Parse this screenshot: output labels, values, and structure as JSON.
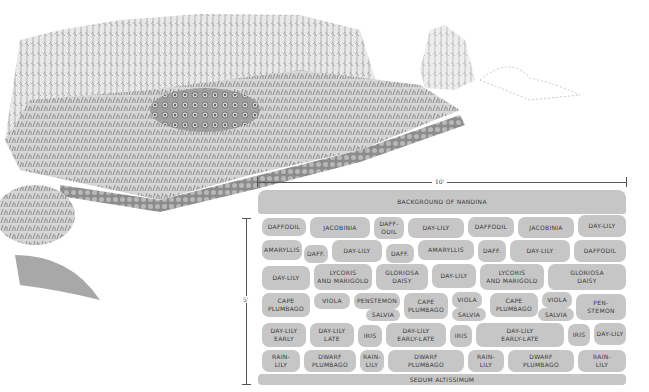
{
  "illustration": {
    "description": "Pen-and-ink perspective drawing of a planted flower border with tall Nandina background, rounded flowering masses, iris and lily clumps, a low sedum edging, a distant shrub at right and a leafy shrub at lower left"
  },
  "dimensions": {
    "width_label": "10'",
    "depth_label": "5'"
  },
  "plan": {
    "background_row": {
      "label": "BACKGROUND OF NANDINA"
    },
    "edging_row": {
      "label": "SEDUM ALTISSIMUM"
    },
    "cells": [
      {
        "label": "DAFFODIL",
        "x": 6,
        "y": 30,
        "w": 44,
        "h": 18
      },
      {
        "label": "JACOBINIA",
        "x": 54,
        "y": 29,
        "w": 60,
        "h": 21
      },
      {
        "label": "DAFF-\nODIL",
        "x": 118,
        "y": 29,
        "w": 30,
        "h": 22
      },
      {
        "label": "DAY-LILY",
        "x": 152,
        "y": 30,
        "w": 56,
        "h": 20
      },
      {
        "label": "DAFFODIL",
        "x": 212,
        "y": 29,
        "w": 46,
        "h": 20
      },
      {
        "label": "JACOBINIA",
        "x": 262,
        "y": 29,
        "w": 56,
        "h": 21
      },
      {
        "label": "DAY-LILY",
        "x": 322,
        "y": 27,
        "w": 48,
        "h": 22
      },
      {
        "label": "AMARYLLIS",
        "x": 6,
        "y": 52,
        "w": 40,
        "h": 20
      },
      {
        "label": "DAFF.",
        "x": 48,
        "y": 57,
        "w": 24,
        "h": 18
      },
      {
        "label": "DAY-LILY",
        "x": 76,
        "y": 52,
        "w": 50,
        "h": 22
      },
      {
        "label": "DAFF.",
        "x": 130,
        "y": 56,
        "w": 28,
        "h": 19
      },
      {
        "label": "AMARYLLIS",
        "x": 162,
        "y": 52,
        "w": 56,
        "h": 20
      },
      {
        "label": "DAFF.",
        "x": 222,
        "y": 52,
        "w": 28,
        "h": 22
      },
      {
        "label": "DAY-LILY",
        "x": 254,
        "y": 52,
        "w": 60,
        "h": 22
      },
      {
        "label": "DAFFODIL",
        "x": 318,
        "y": 52,
        "w": 52,
        "h": 22
      },
      {
        "label": "DAY-LILY",
        "x": 6,
        "y": 78,
        "w": 48,
        "h": 24
      },
      {
        "label": "LYCORIS\nAND MARIGOLD",
        "x": 58,
        "y": 76,
        "w": 58,
        "h": 26
      },
      {
        "label": "GLORIOSA\nDAISY",
        "x": 120,
        "y": 76,
        "w": 52,
        "h": 26
      },
      {
        "label": "DAY-LILY",
        "x": 176,
        "y": 76,
        "w": 44,
        "h": 24
      },
      {
        "label": "LYCORIS\nAND MARIGOLD",
        "x": 224,
        "y": 76,
        "w": 64,
        "h": 26
      },
      {
        "label": "GLORIOSA\nDAISY",
        "x": 292,
        "y": 76,
        "w": 78,
        "h": 26
      },
      {
        "label": "CAPE\nPLUMBAGO",
        "x": 6,
        "y": 105,
        "w": 48,
        "h": 24
      },
      {
        "label": "VIOLA",
        "x": 58,
        "y": 105,
        "w": 36,
        "h": 16
      },
      {
        "label": "PENSTEMON",
        "x": 98,
        "y": 105,
        "w": 46,
        "h": 16
      },
      {
        "label": "SALVIA",
        "x": 110,
        "y": 121,
        "w": 34,
        "h": 12
      },
      {
        "label": "CAPE\nPLUMBAGO",
        "x": 148,
        "y": 105,
        "w": 44,
        "h": 26
      },
      {
        "label": "VIOLA",
        "x": 196,
        "y": 104,
        "w": 30,
        "h": 16
      },
      {
        "label": "SALVIA",
        "x": 196,
        "y": 120,
        "w": 34,
        "h": 13
      },
      {
        "label": "CAPE\nPLUMBAGO",
        "x": 234,
        "y": 105,
        "w": 48,
        "h": 24
      },
      {
        "label": "VIOLA",
        "x": 286,
        "y": 104,
        "w": 30,
        "h": 16
      },
      {
        "label": "SALVIA",
        "x": 282,
        "y": 120,
        "w": 36,
        "h": 13
      },
      {
        "label": "PEN-\nSTEMON",
        "x": 320,
        "y": 106,
        "w": 50,
        "h": 26
      },
      {
        "label": "DAY-LILY\nEARLY",
        "x": 6,
        "y": 135,
        "w": 44,
        "h": 24
      },
      {
        "label": "DAY-LILY\nLATE",
        "x": 54,
        "y": 135,
        "w": 44,
        "h": 24
      },
      {
        "label": "IRIS",
        "x": 102,
        "y": 137,
        "w": 24,
        "h": 22
      },
      {
        "label": "DAY-LILY\nEARLY-LATE",
        "x": 130,
        "y": 135,
        "w": 60,
        "h": 24
      },
      {
        "label": "IRIS",
        "x": 194,
        "y": 137,
        "w": 22,
        "h": 22
      },
      {
        "label": "DAY-LILY\nEARLY-LATE",
        "x": 220,
        "y": 135,
        "w": 88,
        "h": 24
      },
      {
        "label": "IRIS",
        "x": 312,
        "y": 136,
        "w": 22,
        "h": 22
      },
      {
        "label": "DAY-LILY",
        "x": 338,
        "y": 135,
        "w": 32,
        "h": 22
      },
      {
        "label": "RAIN-\nLILY",
        "x": 6,
        "y": 162,
        "w": 38,
        "h": 22
      },
      {
        "label": "DWARF\nPLUMBAGO",
        "x": 48,
        "y": 162,
        "w": 52,
        "h": 22
      },
      {
        "label": "RAIN-\nLILY",
        "x": 104,
        "y": 162,
        "w": 24,
        "h": 22
      },
      {
        "label": "DWARF\nPLUMBAGO",
        "x": 132,
        "y": 162,
        "w": 76,
        "h": 22
      },
      {
        "label": "RAIN-\nLILY",
        "x": 212,
        "y": 162,
        "w": 36,
        "h": 22
      },
      {
        "label": "DWARF\nPLUMBAGO",
        "x": 252,
        "y": 162,
        "w": 66,
        "h": 22
      },
      {
        "label": "RAIN-\nLILY",
        "x": 322,
        "y": 162,
        "w": 48,
        "h": 22
      }
    ]
  },
  "colors": {
    "cell_fill": "#c6c6c6",
    "cell_text": "#3a3a3a",
    "gap": "#ffffff"
  }
}
